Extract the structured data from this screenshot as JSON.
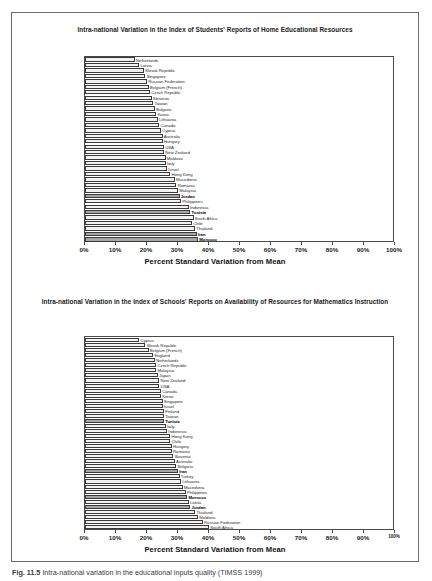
{
  "figure": {
    "caption_prefix": "Fig. 11.5",
    "caption_text": "Intra-national variation in the educational inputs quality (TIMSS 1999)"
  },
  "charts": [
    {
      "id": "home-educational-resources",
      "title": "Intra-national Variation in the Index of Students' Reports of Home Educational Resources",
      "xlabel": "Percent Standard Variation from Mean",
      "x_ticks": [
        "0%",
        "10%",
        "20%",
        "30%",
        "40%",
        "50%",
        "60%",
        "70%",
        "80%",
        "90%",
        "100%"
      ],
      "x_tick_values": [
        0,
        10,
        20,
        30,
        40,
        50,
        60,
        70,
        80,
        90,
        100
      ],
      "xlim": [
        0,
        100
      ]
    },
    {
      "id": "school-resources-mathematics",
      "title": "Intra-national Variation in the Index of Schools' Reports on Availability of Resources for Mathematics Instruction",
      "xlabel": "Percent Standard Variation from Mean",
      "x_ticks": [
        "0%",
        "10%",
        "20%",
        "30%",
        "40%",
        "50%",
        "60%",
        "70%",
        "80%",
        "90%",
        "100%"
      ],
      "x_tick_values": [
        0,
        10,
        20,
        30,
        40,
        50,
        60,
        70,
        80,
        90,
        100
      ],
      "xlim": [
        0,
        100
      ]
    }
  ],
  "chart_data": [
    {
      "type": "bar",
      "orientation": "horizontal",
      "title": "Intra-national Variation in the Index of Students' Reports of Home Educational Resources",
      "xlabel": "Percent Standard Variation from Mean",
      "ylabel": "",
      "xlim": [
        0,
        100
      ],
      "grid": false,
      "legend": "none",
      "highlight_color": "#a6a6a6",
      "default_color": "#f2f2f2",
      "categories": [
        "Netherlands",
        "Latvia",
        "Slovak Republic",
        "Singapore",
        "Russian Federation",
        "Belgium (French)",
        "Czech Republic",
        "Slovenia",
        "Taiwan",
        "Bulgaria",
        "Korea",
        "Lithuania",
        "Canada",
        "Cyprus",
        "Australia",
        "Hungary",
        "USA",
        "New Zealand",
        "Moldova",
        "Italy",
        "Israel",
        "Hong Kong",
        "Macedonia",
        "Romania",
        "Malaysia",
        "Jordan",
        "Philippines",
        "Indonesia",
        "Tunisia",
        "South Africa",
        "Chile",
        "Thailand",
        "Iran",
        "Morocco"
      ],
      "values": [
        16.0,
        17.5,
        19.0,
        19.5,
        20.0,
        20.5,
        21.0,
        21.5,
        22.0,
        22.5,
        23.0,
        23.5,
        24.0,
        24.5,
        25.0,
        25.0,
        25.5,
        25.5,
        26.0,
        26.0,
        26.5,
        27.5,
        29.0,
        29.5,
        30.0,
        30.5,
        31.0,
        33.5,
        34.0,
        35.0,
        34.5,
        35.5,
        36.0,
        36.5
      ],
      "highlighted": [
        "Jordan",
        "Tunisia",
        "Iran",
        "Morocco"
      ]
    },
    {
      "type": "bar",
      "orientation": "horizontal",
      "title": "Intra-national Variation in the Index of Schools' Reports on Availability of Resources for Mathematics Instruction",
      "xlabel": "Percent Standard Variation from Mean",
      "ylabel": "",
      "xlim": [
        0,
        100
      ],
      "grid": false,
      "legend": "none",
      "highlight_color": "#a6a6a6",
      "default_color": "#f2f2f2",
      "categories": [
        "Cyprus",
        "Slovak Republic",
        "Belgium (French)",
        "England",
        "Netherlands",
        "Czech Republic",
        "Malaysia",
        "Japan",
        "New Zealand",
        "USA",
        "Canada",
        "Korea",
        "Singapore",
        "Israel",
        "Finland",
        "Taiwan",
        "Tunisia",
        "Italy",
        "Indonesia",
        "Hong Kong",
        "Chile",
        "Hungary",
        "Romania",
        "Slovenia",
        "Australia",
        "Bulgaria",
        "Iran",
        "Turkey",
        "Lithuania",
        "Macedonia",
        "Philippines",
        "Morocco",
        "Latvia",
        "Jordan",
        "Thailand",
        "Moldova",
        "Russian Federation",
        "South Africa"
      ],
      "values": [
        17.5,
        19.5,
        20.5,
        22.0,
        22.5,
        23.0,
        23.0,
        23.5,
        24.0,
        24.0,
        24.5,
        24.5,
        25.0,
        25.0,
        25.5,
        25.5,
        25.5,
        26.0,
        26.5,
        27.5,
        27.5,
        28.0,
        28.0,
        28.5,
        29.0,
        29.5,
        30.0,
        30.5,
        31.0,
        31.5,
        32.5,
        33.0,
        33.5,
        34.0,
        35.5,
        36.5,
        38.0,
        40.0
      ],
      "highlighted": [
        "Tunisia",
        "Iran",
        "Morocco",
        "Jordan"
      ]
    }
  ]
}
